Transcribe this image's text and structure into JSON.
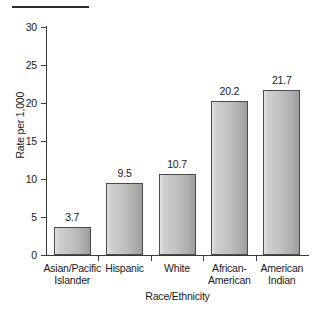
{
  "chart_data": {
    "type": "bar",
    "title": "",
    "subtitle": "",
    "xlabel": "Race/Ethnicity",
    "ylabel": "Rate per 1,000",
    "categories": [
      "Asian/Pacific\nIslander",
      "Hispanic",
      "White",
      "African-\nAmerican",
      "American\nIndian"
    ],
    "values": [
      3.7,
      9.5,
      10.7,
      20.2,
      21.7
    ],
    "value_labels": [
      "3.7",
      "9.5",
      "10.7",
      "20.2",
      "21.7"
    ],
    "ylim": [
      0,
      30
    ],
    "yticks": [
      0,
      5,
      10,
      15,
      20,
      25,
      30
    ],
    "ytick_labels": [
      "0",
      "5",
      "10",
      "15",
      "20",
      "25",
      "30"
    ],
    "grid": false,
    "legend": null,
    "legend_position": "none",
    "bar_fill_light": "#e2e2e2",
    "bar_fill_dark": "#9d9d9d",
    "bar_border_color": "#4a4a4a",
    "axis_color": "#3a3a3a",
    "text_color": "#1a1a1a",
    "background": "#ffffff"
  },
  "decorations": {
    "top_rule": ""
  }
}
